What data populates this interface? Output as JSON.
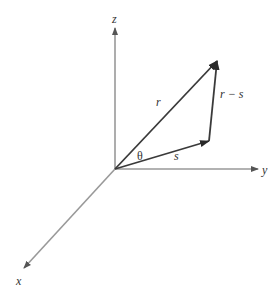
{
  "diagram": {
    "axes": [
      {
        "name": "z",
        "label": "z"
      },
      {
        "name": "y",
        "label": "y"
      },
      {
        "name": "x",
        "label": "x"
      }
    ],
    "vectors": [
      {
        "name": "r",
        "label": "r"
      },
      {
        "name": "s",
        "label": "s"
      },
      {
        "name": "r-s",
        "label": "r − s"
      }
    ],
    "angle_label": "θ",
    "colors": {
      "axis": "#999999",
      "vector": "#3a3a3a",
      "background": "#ffffff"
    }
  }
}
